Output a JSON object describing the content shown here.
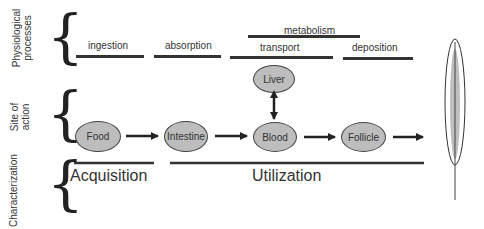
{
  "rows": {
    "physiological": "Physiological processes",
    "physiological_l1": "Physiological",
    "physiological_l2": "processes",
    "site_l1": "Site of",
    "site_l2": "action",
    "characterization": "Characterization"
  },
  "processes": {
    "ingestion": "ingestion",
    "absorption": "absorption",
    "metabolism": "metabolism",
    "transport": "transport",
    "deposition": "deposition"
  },
  "sites": {
    "food": "Food",
    "intestine": "Intestine",
    "liver": "Liver",
    "blood": "Blood",
    "follicle": "Follicle"
  },
  "characterization": {
    "acquisition": "Acquisition",
    "utilization": "Utilization"
  },
  "colors": {
    "node_fill": "#bdbdbd",
    "line": "#333333"
  },
  "icons": {
    "end_product": "feather-icon"
  }
}
